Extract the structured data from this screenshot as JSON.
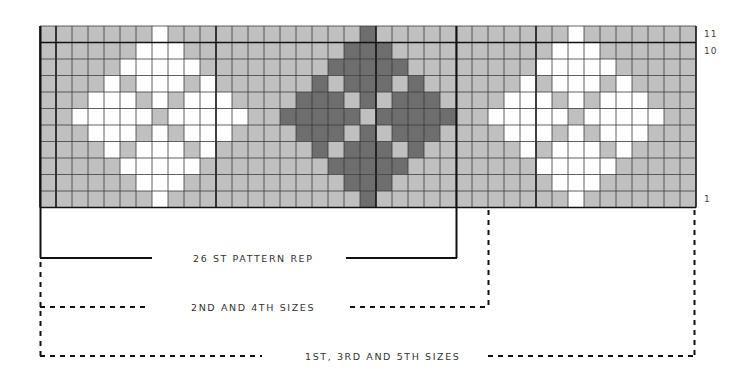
{
  "chart": {
    "columns": 41,
    "rows": 11,
    "colors": {
      "background": "#c0c0c0",
      "contrast_light": "#ffffff",
      "contrast_dark": "#6e6e6e",
      "grid_line": "#3a3a3a"
    },
    "motif_shape": [
      [
        0
      ],
      [
        -1,
        0,
        1
      ],
      [
        -2,
        -1,
        0,
        1,
        2
      ],
      [
        -3,
        -1,
        0,
        1,
        3
      ],
      [
        -4,
        -3,
        -2,
        0,
        2,
        3,
        4
      ],
      [
        -5,
        -4,
        -3,
        -2,
        -1,
        1,
        2,
        3,
        4,
        5
      ],
      [
        -4,
        -3,
        -2,
        0,
        2,
        3,
        4
      ],
      [
        -3,
        -1,
        0,
        1,
        3
      ],
      [
        -2,
        -1,
        0,
        1,
        2
      ],
      [
        -1,
        0,
        1
      ],
      [
        0
      ]
    ],
    "motifs": [
      {
        "center_col": 7,
        "color": "contrast_light"
      },
      {
        "center_col": 20,
        "color": "contrast_dark"
      },
      {
        "center_col": 33,
        "color": "contrast_light"
      }
    ],
    "row_labels": [
      {
        "row": 11,
        "text": "11"
      },
      {
        "row": 10,
        "text": "10"
      },
      {
        "row": 1,
        "text": "1"
      }
    ]
  },
  "brackets": {
    "pattern_rep": {
      "label": "26 ST PATTERN REP",
      "stitches": 26,
      "style": "solid"
    },
    "sizes_2_4": {
      "label": "2ND AND 4TH SIZES",
      "style": "dashed"
    },
    "sizes_1_3_5": {
      "label": "1ST, 3RD AND 5TH SIZES",
      "style": "dashed"
    }
  },
  "chart_data": {
    "type": "table",
    "grid": {
      "columns": 41,
      "rows": 11,
      "row_numbering": "1 (bottom) to 11 (top)"
    },
    "legend": [
      {
        "color": "#c0c0c0",
        "meaning": "main colour"
      },
      {
        "color": "#ffffff",
        "meaning": "contrast colour A"
      },
      {
        "color": "#6e6e6e",
        "meaning": "contrast colour B"
      }
    ],
    "annotations": [
      "26 ST PATTERN REP",
      "2ND AND 4TH SIZES",
      "1ST, 3RD AND 5TH SIZES"
    ],
    "tick_labels": [
      "11",
      "10",
      "1"
    ]
  }
}
